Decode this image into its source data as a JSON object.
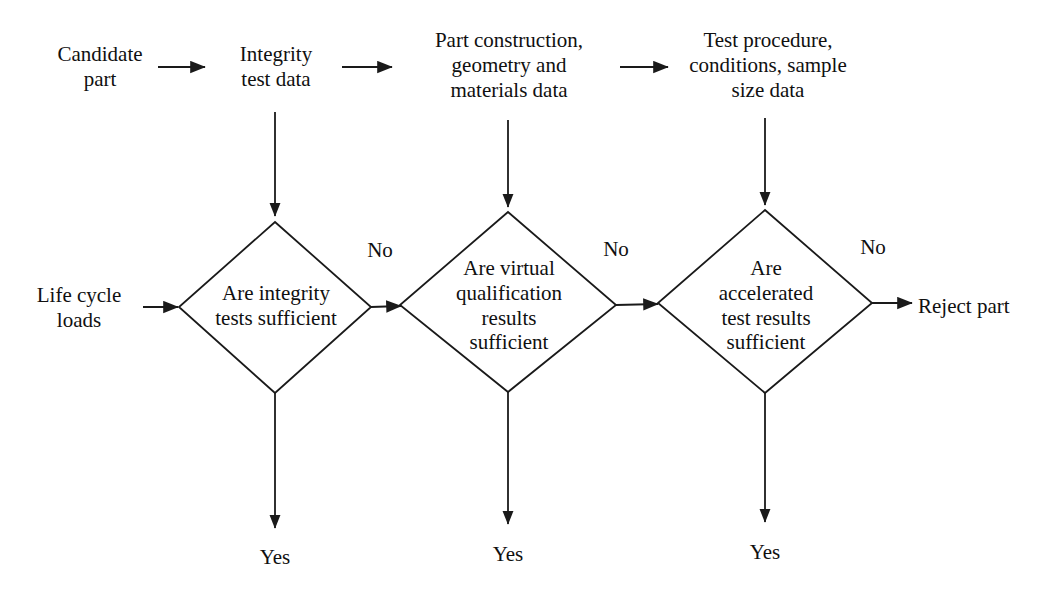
{
  "diagram": {
    "background_color": "#ffffff",
    "line_color": "#1a1a1a",
    "text_color": "#101010"
  },
  "inputs": {
    "candidate_part": "Candidate\npart",
    "integrity_test_data": "Integrity\ntest data",
    "part_construction": "Part construction,\ngeometry and\nmaterials data",
    "test_procedure": "Test procedure,\nconditions, sample\nsize data",
    "life_cycle_loads": "Life cycle\nloads"
  },
  "decisions": [
    {
      "id": "integrity",
      "text": "Are integrity\ntests sufficient",
      "no_label": "No",
      "yes_label": "Yes"
    },
    {
      "id": "virtual-qualification",
      "text": "Are virtual\nqualification\nresults\nsufficient",
      "no_label": "No",
      "yes_label": "Yes"
    },
    {
      "id": "accelerated-test",
      "text": "Are\naccelerated\ntest results\nsufficient",
      "no_label": "No",
      "yes_label": "Yes"
    }
  ],
  "outcomes": {
    "reject_part": "Reject part"
  }
}
